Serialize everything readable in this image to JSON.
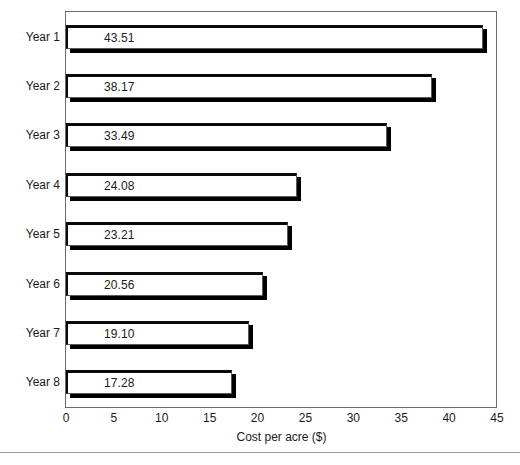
{
  "chart_data": {
    "type": "bar",
    "orientation": "horizontal",
    "title": "",
    "subtitle": "",
    "xlabel": "Cost per acre ($)",
    "ylabel": "",
    "categories": [
      "Year 1",
      "Year 2",
      "Year 3",
      "Year 4",
      "Year 5",
      "Year 6",
      "Year 7",
      "Year 8"
    ],
    "values": [
      43.51,
      38.17,
      33.49,
      24.08,
      23.21,
      20.56,
      19.1,
      17.28
    ],
    "value_labels": [
      "43.51",
      "38.17",
      "33.49",
      "24.08",
      "23.21",
      "20.56",
      "19.10",
      "17.28"
    ],
    "xlim": [
      0,
      45
    ],
    "xticks": [
      0,
      5,
      10,
      15,
      20,
      25,
      30,
      35,
      40,
      45
    ],
    "xtick_labels": [
      "0",
      "5",
      "10",
      "15",
      "20",
      "25",
      "30",
      "35",
      "40",
      "45"
    ],
    "grid": false,
    "legend": null,
    "legend_position": "none",
    "bar_fill_color": "#ffffff",
    "bar_outline_color": "#0a0a0a",
    "bar_shadow_color": "#000000",
    "plot_border_color": "#6b6b6b",
    "text_color": "#1a1a1a",
    "background_color": "#ffffff",
    "data_labels_inside_bars": true,
    "annotations": []
  },
  "footer": {
    "rule_color": "#9a9a9a",
    "clipped_caption": ""
  }
}
